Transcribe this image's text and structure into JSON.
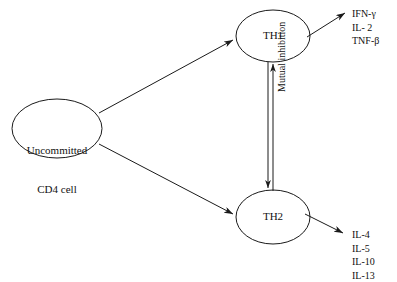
{
  "diagram": {
    "nodes": [
      {
        "id": "uncommitted",
        "label_line1": "Uncommitted",
        "label_line2": "CD4 cell"
      },
      {
        "id": "th1",
        "label": "TH1"
      },
      {
        "id": "th2",
        "label": "TH2"
      }
    ],
    "edges": [
      {
        "id": "uncommitted-to-th1",
        "kind": "differentiation-arrow"
      },
      {
        "id": "uncommitted-to-th2",
        "kind": "differentiation-arrow"
      },
      {
        "id": "th1-to-th2-inhibition",
        "kind": "inhibition-arrow-down"
      },
      {
        "id": "th2-to-th1-inhibition",
        "kind": "inhibition-arrow-up"
      },
      {
        "id": "th1-to-cytokines",
        "kind": "secretion-arrow"
      },
      {
        "id": "th2-to-cytokines",
        "kind": "secretion-arrow"
      }
    ],
    "edge_label": "Mutual inhibition",
    "th1_cytokines": [
      "IFN-γ",
      "IL- 2",
      "TNF-β"
    ],
    "th2_cytokines": [
      "IL-4",
      "IL-5",
      "IL-10",
      "IL-13"
    ],
    "colors": {
      "stroke": "#1a1a1a",
      "text": "#111111",
      "background": "#ffffff"
    }
  }
}
